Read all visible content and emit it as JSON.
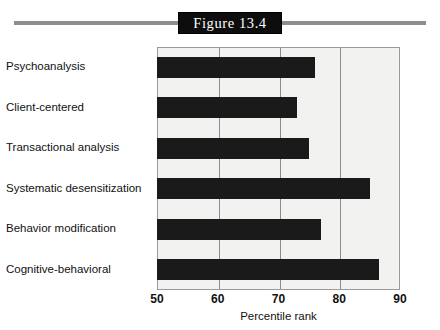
{
  "figure": {
    "title": "Figure 13.4",
    "title_box_color": "#0d0d0d",
    "title_text_color": "#ffffff",
    "rule_color": "#8e8e8e"
  },
  "chart_data": {
    "type": "bar",
    "orientation": "horizontal",
    "title": "Figure 13.4",
    "xlabel": "Percentile rank",
    "ylabel": "",
    "xlim": [
      50,
      90
    ],
    "xticks": [
      50,
      60,
      70,
      80,
      90
    ],
    "xticklabels": [
      "50",
      "60",
      "70",
      "80",
      "90"
    ],
    "grid": true,
    "grid_axis": "x",
    "legend": false,
    "bar_color": "#1a1a1a",
    "plot_background": "#f2f2f0",
    "categories": [
      "Psychoanalysis",
      "Client-centered",
      "Transactional analysis",
      "Systematic desensitization",
      "Behavior modification",
      "Cognitive-behavioral"
    ],
    "values": [
      76,
      73,
      75,
      85,
      77,
      86.5
    ]
  }
}
